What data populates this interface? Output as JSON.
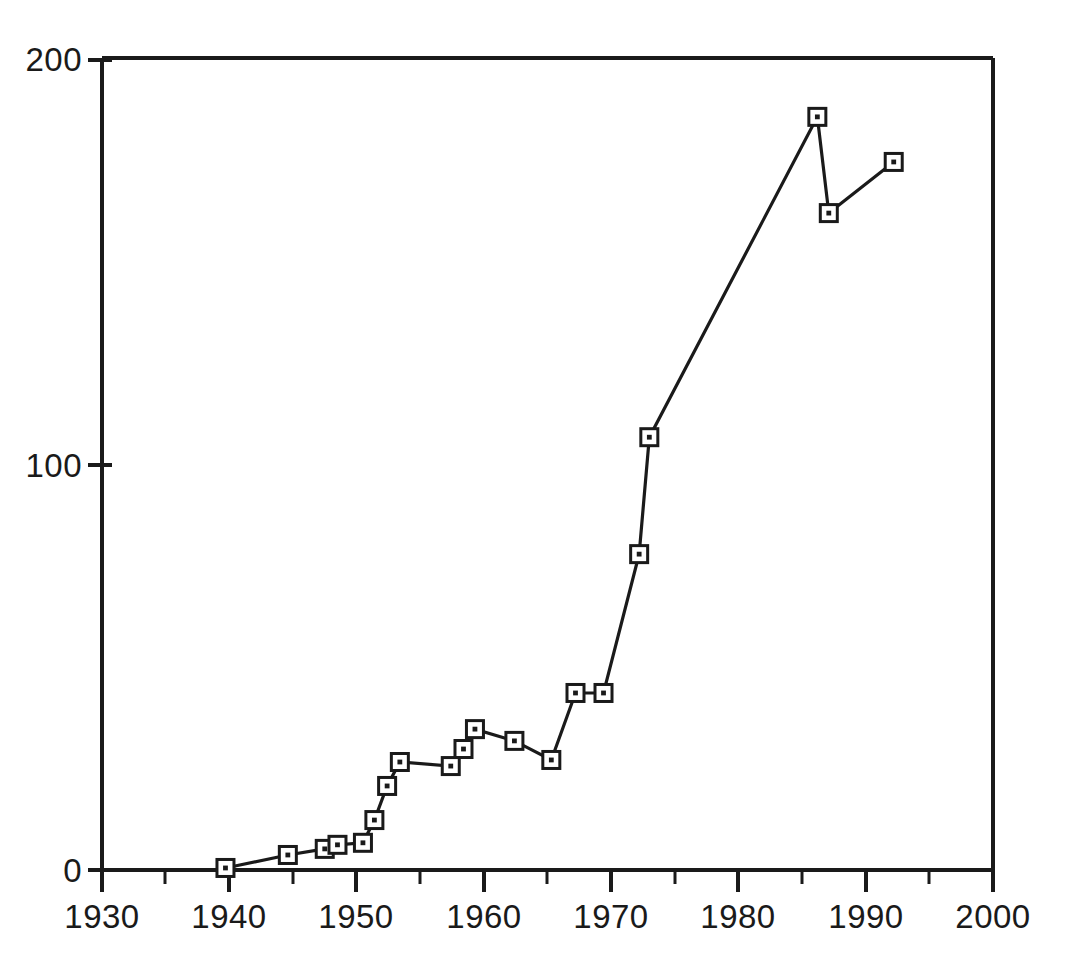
{
  "chart_data": {
    "type": "line",
    "title": "",
    "subtitle": "",
    "xlabel": "",
    "ylabel": "",
    "xlim": [
      1930,
      2000
    ],
    "ylim": [
      0,
      200
    ],
    "grid": false,
    "legend": null,
    "x_ticks_major": [
      1930,
      1940,
      1950,
      1960,
      1970,
      1980,
      1990,
      2000
    ],
    "x_tick_labels": [
      "1930",
      "1940",
      "1950",
      "1960",
      "1970",
      "1980",
      "1990",
      "2000"
    ],
    "x_ticks_minor": [
      1935,
      1945,
      1955,
      1965,
      1975,
      1985,
      1995
    ],
    "y_ticks_major": [
      0,
      100,
      200
    ],
    "y_tick_labels": [
      "0",
      "100",
      "200"
    ],
    "marker": "square-with-center-dot",
    "line_color": "#1a1a1a",
    "marker_face_color": "#ffffff",
    "marker_edge_color": "#1a1a1a",
    "series": [
      {
        "name": "series-1",
        "x": [
          1939.7,
          1944.6,
          1947.5,
          1948.5,
          1950.5,
          1951.4,
          1952.4,
          1953.4,
          1957.4,
          1958.4,
          1959.3,
          1962.4,
          1965.3,
          1967.2,
          1969.4,
          1972.2,
          1973.0,
          1986.2,
          1987.1,
          1992.2
        ],
        "values": [
          0.5,
          3.7,
          5.2,
          6.2,
          6.7,
          12.3,
          20.7,
          26.6,
          25.6,
          29.8,
          34.7,
          31.8,
          27.1,
          43.6,
          43.6,
          77.8,
          106.6,
          185.5,
          161.8,
          174.4
        ]
      }
    ]
  },
  "axes": {
    "frame": "left-top-right-bottom-open-right-bottom",
    "tick_direction": "out"
  }
}
